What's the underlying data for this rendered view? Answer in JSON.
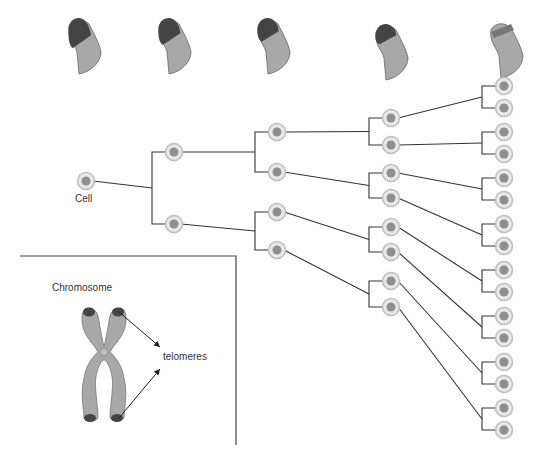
{
  "diagram": {
    "labels": {
      "cell": "Cell",
      "chromosome": "Chromosome",
      "telomeres": "telomeres"
    },
    "colors": {
      "line": "#333333",
      "cell_outer": "#e8e8e8",
      "cell_ring": "#bdbdbd",
      "cell_nucleus": "#8f8f8f",
      "chromosome_body": "#a8a8a8",
      "telomere": "#444444"
    },
    "top_chromosome_arms": {
      "count": 5,
      "description": "Chromosome arm with telomere cap progressively shrinking across generations",
      "x_positions": [
        83,
        173,
        272,
        390,
        505
      ],
      "telomere_size": [
        1.0,
        0.85,
        0.7,
        0.55,
        0.2
      ]
    },
    "tree": {
      "generations": [
        {
          "level": 0,
          "x": 86,
          "y": [
            181
          ]
        },
        {
          "level": 1,
          "x": 174,
          "y": [
            152,
            224
          ]
        },
        {
          "level": 2,
          "x": 277,
          "y": [
            132,
            172,
            212,
            250
          ]
        },
        {
          "level": 3,
          "x": 391,
          "y": [
            118,
            145,
            173,
            198,
            227,
            252,
            281,
            307
          ]
        },
        {
          "level": 4,
          "x": 504,
          "y": [
            86,
            108,
            132,
            154,
            178,
            200,
            224,
            246,
            270,
            292,
            316,
            338,
            362,
            384,
            408,
            430
          ]
        }
      ]
    },
    "inset": {
      "label": "Chromosome",
      "annotation": "telomeres"
    }
  }
}
